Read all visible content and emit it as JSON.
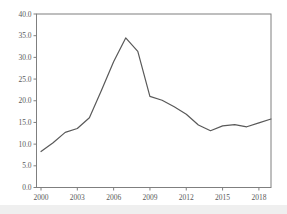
{
  "chart_data": {
    "type": "line",
    "title": "",
    "xlabel": "",
    "ylabel": "",
    "x": [
      2000,
      2001,
      2002,
      2003,
      2004,
      2005,
      2006,
      2007,
      2008,
      2009,
      2010,
      2011,
      2012,
      2013,
      2014,
      2015,
      2016,
      2017,
      2018,
      2019
    ],
    "series": [
      {
        "name": "value",
        "values": [
          8.3,
          10.3,
          12.7,
          13.6,
          16.1,
          22.4,
          29.0,
          34.5,
          31.4,
          21.0,
          20.1,
          18.6,
          16.9,
          14.4,
          13.1,
          14.2,
          14.5,
          14.0,
          14.9,
          15.8
        ]
      }
    ],
    "x_tick_labels": [
      "2000",
      "2003",
      "2006",
      "2009",
      "2012",
      "2015",
      "2018"
    ],
    "x_tick_values": [
      2000,
      2003,
      2006,
      2009,
      2012,
      2015,
      2018
    ],
    "y_tick_labels": [
      "0.0",
      "5.0",
      "10.0",
      "15.0",
      "20.0",
      "25.0",
      "30.0",
      "35.0",
      "40.0"
    ],
    "y_tick_values": [
      0,
      5,
      10,
      15,
      20,
      25,
      30,
      35,
      40
    ],
    "xlim": [
      2000,
      2019
    ],
    "ylim": [
      0,
      40
    ],
    "grid": false,
    "legend_position": "none",
    "colors": {
      "line": "#595959",
      "plot_border": "#7f7f7f",
      "tick_text": "#595959",
      "background": "#ffffff"
    }
  }
}
